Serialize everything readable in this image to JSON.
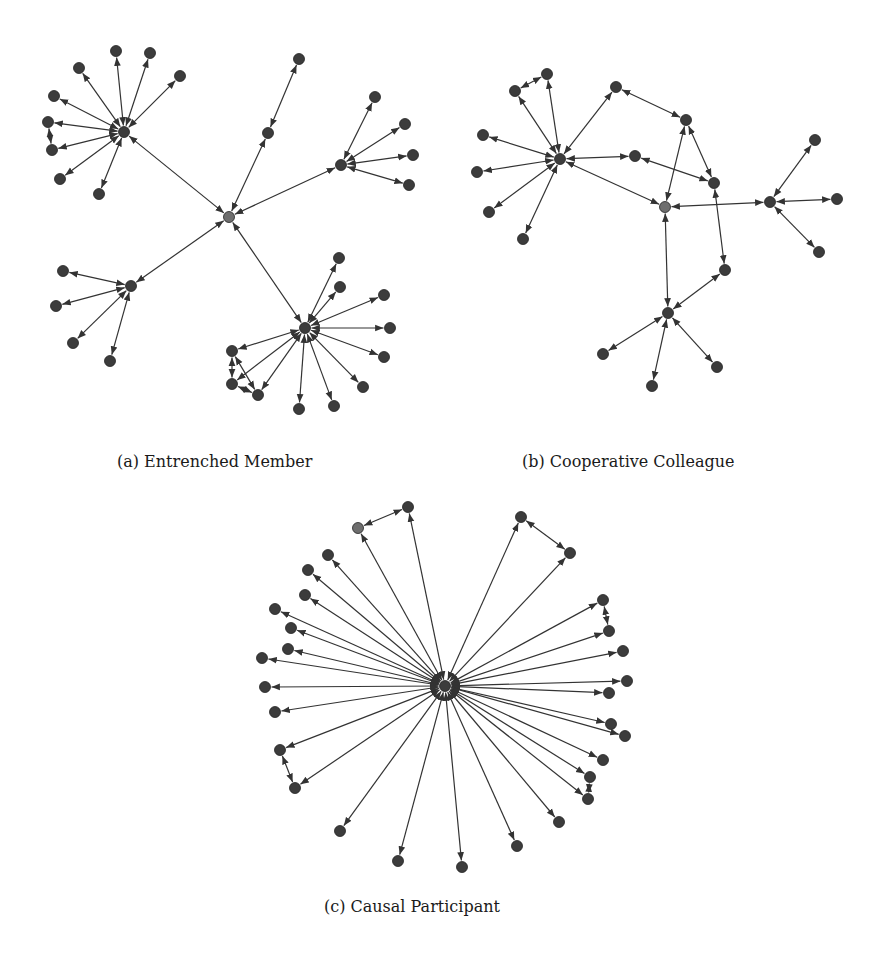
{
  "figure": {
    "colors": {
      "node": "#3c3c3c",
      "center_node": "#6e6e6e",
      "edge": "#333333",
      "background": "#ffffff"
    },
    "node_radius": 5.5,
    "panels": [
      {
        "id": "a",
        "caption": "(a) Entrenched Member",
        "nodes": [
          {
            "id": "c",
            "x": 229,
            "y": 217,
            "center": true
          },
          {
            "id": "h1",
            "x": 124,
            "y": 132
          },
          {
            "id": "h1a",
            "x": 116,
            "y": 51
          },
          {
            "id": "h1b",
            "x": 150,
            "y": 53
          },
          {
            "id": "h1c",
            "x": 180,
            "y": 76
          },
          {
            "id": "h1d",
            "x": 79,
            "y": 68
          },
          {
            "id": "h1e",
            "x": 54,
            "y": 96
          },
          {
            "id": "h1f",
            "x": 48,
            "y": 122
          },
          {
            "id": "h1g",
            "x": 52,
            "y": 150
          },
          {
            "id": "h1h",
            "x": 60,
            "y": 179
          },
          {
            "id": "h1i",
            "x": 99,
            "y": 194
          },
          {
            "id": "m1",
            "x": 268,
            "y": 133
          },
          {
            "id": "m1a",
            "x": 299,
            "y": 59
          },
          {
            "id": "h2",
            "x": 341,
            "y": 165
          },
          {
            "id": "h2a",
            "x": 375,
            "y": 97
          },
          {
            "id": "h2b",
            "x": 405,
            "y": 124
          },
          {
            "id": "h2c",
            "x": 413,
            "y": 155
          },
          {
            "id": "h2d",
            "x": 409,
            "y": 185
          },
          {
            "id": "h3",
            "x": 131,
            "y": 286
          },
          {
            "id": "h3a",
            "x": 63,
            "y": 271
          },
          {
            "id": "h3b",
            "x": 56,
            "y": 306
          },
          {
            "id": "h3c",
            "x": 73,
            "y": 343
          },
          {
            "id": "h3d",
            "x": 110,
            "y": 361
          },
          {
            "id": "h4",
            "x": 305,
            "y": 328
          },
          {
            "id": "h4a",
            "x": 339,
            "y": 258
          },
          {
            "id": "h4b",
            "x": 340,
            "y": 287
          },
          {
            "id": "h4c",
            "x": 384,
            "y": 295
          },
          {
            "id": "h4d",
            "x": 390,
            "y": 328
          },
          {
            "id": "h4e",
            "x": 384,
            "y": 357
          },
          {
            "id": "h4f",
            "x": 363,
            "y": 387
          },
          {
            "id": "h4g",
            "x": 334,
            "y": 406
          },
          {
            "id": "h4h",
            "x": 299,
            "y": 409
          },
          {
            "id": "h4i",
            "x": 258,
            "y": 395
          },
          {
            "id": "h4j",
            "x": 232,
            "y": 384
          },
          {
            "id": "h4k",
            "x": 232,
            "y": 351
          }
        ],
        "edges": [
          [
            "c",
            "h1"
          ],
          [
            "c",
            "m1"
          ],
          [
            "c",
            "h2"
          ],
          [
            "c",
            "h3"
          ],
          [
            "c",
            "h4"
          ],
          [
            "h1",
            "h1a"
          ],
          [
            "h1",
            "h1b"
          ],
          [
            "h1",
            "h1c"
          ],
          [
            "h1",
            "h1d"
          ],
          [
            "h1",
            "h1e"
          ],
          [
            "h1",
            "h1f"
          ],
          [
            "h1",
            "h1g"
          ],
          [
            "h1",
            "h1h"
          ],
          [
            "h1",
            "h1i"
          ],
          [
            "h1g",
            "h1f"
          ],
          [
            "m1",
            "m1a"
          ],
          [
            "h2",
            "h2a"
          ],
          [
            "h2",
            "h2b"
          ],
          [
            "h2",
            "h2c"
          ],
          [
            "h2",
            "h2d"
          ],
          [
            "h3",
            "h3a"
          ],
          [
            "h3",
            "h3b"
          ],
          [
            "h3",
            "h3c"
          ],
          [
            "h3",
            "h3d"
          ],
          [
            "h4",
            "h4a"
          ],
          [
            "h4",
            "h4b"
          ],
          [
            "h4",
            "h4c"
          ],
          [
            "h4",
            "h4d"
          ],
          [
            "h4",
            "h4e"
          ],
          [
            "h4",
            "h4f"
          ],
          [
            "h4",
            "h4g"
          ],
          [
            "h4",
            "h4h"
          ],
          [
            "h4",
            "h4i"
          ],
          [
            "h4",
            "h4j"
          ],
          [
            "h4",
            "h4k"
          ],
          [
            "h4k",
            "h4j"
          ],
          [
            "h4k",
            "h4i"
          ],
          [
            "h4j",
            "h4i"
          ]
        ]
      },
      {
        "id": "b",
        "caption": "(b) Cooperative Colleague",
        "nodes": [
          {
            "id": "c",
            "x": 665,
            "y": 207,
            "center": true
          },
          {
            "id": "h1",
            "x": 560,
            "y": 159
          },
          {
            "id": "a1",
            "x": 547,
            "y": 74
          },
          {
            "id": "a2",
            "x": 515,
            "y": 91
          },
          {
            "id": "a3",
            "x": 483,
            "y": 135
          },
          {
            "id": "a4",
            "x": 477,
            "y": 172
          },
          {
            "id": "a5",
            "x": 489,
            "y": 212
          },
          {
            "id": "a6",
            "x": 523,
            "y": 239
          },
          {
            "id": "n1",
            "x": 616,
            "y": 87
          },
          {
            "id": "n2",
            "x": 635,
            "y": 156
          },
          {
            "id": "n3",
            "x": 686,
            "y": 120
          },
          {
            "id": "n4",
            "x": 714,
            "y": 183
          },
          {
            "id": "h2",
            "x": 770,
            "y": 202
          },
          {
            "id": "b1",
            "x": 815,
            "y": 140
          },
          {
            "id": "b2",
            "x": 837,
            "y": 199
          },
          {
            "id": "b3",
            "x": 819,
            "y": 252
          },
          {
            "id": "n5",
            "x": 725,
            "y": 270
          },
          {
            "id": "h3",
            "x": 668,
            "y": 313
          },
          {
            "id": "d1",
            "x": 603,
            "y": 354
          },
          {
            "id": "d2",
            "x": 652,
            "y": 386
          },
          {
            "id": "d3",
            "x": 717,
            "y": 367
          }
        ],
        "edges": [
          [
            "h1",
            "a1"
          ],
          [
            "h1",
            "a2"
          ],
          [
            "h1",
            "a3"
          ],
          [
            "h1",
            "a4"
          ],
          [
            "h1",
            "a5"
          ],
          [
            "h1",
            "a6"
          ],
          [
            "a1",
            "a2"
          ],
          [
            "h1",
            "n1"
          ],
          [
            "h1",
            "n2"
          ],
          [
            "h1",
            "c"
          ],
          [
            "n1",
            "n3"
          ],
          [
            "n3",
            "c"
          ],
          [
            "n3",
            "n4"
          ],
          [
            "n2",
            "n4"
          ],
          [
            "n4",
            "n5"
          ],
          [
            "c",
            "h2"
          ],
          [
            "h2",
            "b1"
          ],
          [
            "h2",
            "b2"
          ],
          [
            "h2",
            "b3"
          ],
          [
            "c",
            "h3"
          ],
          [
            "h3",
            "n5"
          ],
          [
            "h3",
            "d1"
          ],
          [
            "h3",
            "d2"
          ],
          [
            "h3",
            "d3"
          ]
        ]
      },
      {
        "id": "c",
        "caption": "(c) Causal Participant",
        "nodes": [
          {
            "id": "hub",
            "x": 445,
            "y": 686
          },
          {
            "id": "p1",
            "x": 358,
            "y": 528,
            "center": true
          },
          {
            "id": "p2",
            "x": 408,
            "y": 507
          },
          {
            "id": "p3",
            "x": 521,
            "y": 517
          },
          {
            "id": "p4",
            "x": 570,
            "y": 553
          },
          {
            "id": "p5",
            "x": 328,
            "y": 555
          },
          {
            "id": "p6",
            "x": 308,
            "y": 570
          },
          {
            "id": "p7",
            "x": 305,
            "y": 595
          },
          {
            "id": "p8",
            "x": 275,
            "y": 609
          },
          {
            "id": "p9",
            "x": 291,
            "y": 628
          },
          {
            "id": "p10",
            "x": 288,
            "y": 649
          },
          {
            "id": "p11",
            "x": 262,
            "y": 658
          },
          {
            "id": "p12",
            "x": 265,
            "y": 687
          },
          {
            "id": "p13",
            "x": 275,
            "y": 712
          },
          {
            "id": "p14",
            "x": 280,
            "y": 750
          },
          {
            "id": "p15",
            "x": 295,
            "y": 788
          },
          {
            "id": "p16",
            "x": 340,
            "y": 831
          },
          {
            "id": "p17",
            "x": 398,
            "y": 861
          },
          {
            "id": "p18",
            "x": 462,
            "y": 867
          },
          {
            "id": "p19",
            "x": 517,
            "y": 846
          },
          {
            "id": "p20",
            "x": 559,
            "y": 822
          },
          {
            "id": "p21",
            "x": 588,
            "y": 799
          },
          {
            "id": "p22",
            "x": 590,
            "y": 777
          },
          {
            "id": "p23",
            "x": 603,
            "y": 760
          },
          {
            "id": "p24",
            "x": 625,
            "y": 736
          },
          {
            "id": "p25",
            "x": 611,
            "y": 724
          },
          {
            "id": "p26",
            "x": 609,
            "y": 693
          },
          {
            "id": "p27",
            "x": 627,
            "y": 681
          },
          {
            "id": "p28",
            "x": 623,
            "y": 651
          },
          {
            "id": "p29",
            "x": 609,
            "y": 631
          },
          {
            "id": "p30",
            "x": 603,
            "y": 600
          }
        ],
        "edges": [
          [
            "hub",
            "p1"
          ],
          [
            "hub",
            "p2"
          ],
          [
            "p1",
            "p2"
          ],
          [
            "hub",
            "p3"
          ],
          [
            "hub",
            "p4"
          ],
          [
            "p3",
            "p4"
          ],
          [
            "hub",
            "p5"
          ],
          [
            "hub",
            "p6"
          ],
          [
            "hub",
            "p7"
          ],
          [
            "hub",
            "p8"
          ],
          [
            "hub",
            "p9"
          ],
          [
            "hub",
            "p10"
          ],
          [
            "hub",
            "p11"
          ],
          [
            "hub",
            "p12"
          ],
          [
            "hub",
            "p13"
          ],
          [
            "hub",
            "p14"
          ],
          [
            "hub",
            "p15"
          ],
          [
            "p14",
            "p15"
          ],
          [
            "hub",
            "p16"
          ],
          [
            "hub",
            "p17"
          ],
          [
            "hub",
            "p18"
          ],
          [
            "hub",
            "p19"
          ],
          [
            "hub",
            "p20"
          ],
          [
            "hub",
            "p21"
          ],
          [
            "hub",
            "p22"
          ],
          [
            "p22",
            "p21"
          ],
          [
            "hub",
            "p23"
          ],
          [
            "hub",
            "p24"
          ],
          [
            "hub",
            "p25"
          ],
          [
            "hub",
            "p26"
          ],
          [
            "hub",
            "p27"
          ],
          [
            "hub",
            "p28"
          ],
          [
            "hub",
            "p29"
          ],
          [
            "hub",
            "p30"
          ],
          [
            "p30",
            "p29"
          ]
        ]
      }
    ]
  }
}
